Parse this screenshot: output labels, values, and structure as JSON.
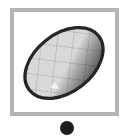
{
  "app": {
    "background_color": "#ffffff",
    "width": 132,
    "height": 139
  },
  "thumbnail": {
    "name": "egg-thumbnail",
    "alt_text": "Decorated egg with diamond checkerboard pattern",
    "frame": {
      "border_color": "#b4b4b4",
      "border_width_px": 4,
      "fill_color": "#ffffff",
      "left": 10,
      "top": 8,
      "width": 109,
      "height": 108
    },
    "artwork": {
      "subject": "egg",
      "pattern": "argyle-diamond-checkerboard",
      "rotation_degrees": -38,
      "outline_color": "#262626",
      "light_diamond_color": "#d9d9d9",
      "dark_diamond_color": "#4d4d4d",
      "shadow_side_color": "#3a3a3a",
      "highlight_notch_color": "#f2f2f2",
      "center_x": 58,
      "center_y": 57,
      "radius_x": 47,
      "radius_y": 31
    }
  },
  "indicator": {
    "name": "selection-dot",
    "color": "#1e1e1e",
    "diameter_px": 14,
    "center_x": 67,
    "center_y": 128,
    "count": 1,
    "label": ""
  }
}
